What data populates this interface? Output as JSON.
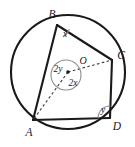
{
  "figure": {
    "type": "circle-geometry-diagram",
    "stroke_color": "#1a1a1a",
    "arc_color": "#8c8c8c",
    "background_color": "#ffffff"
  },
  "circle": {
    "center_label": "O",
    "center": {
      "x": 68,
      "y": 72
    },
    "radius": 57,
    "center_dot_radius": 1.8
  },
  "vertices": [
    {
      "name": "B",
      "label": "B",
      "point": {
        "x": 57,
        "y": 25
      },
      "label_pos": {
        "x": 52,
        "y": 15
      }
    },
    {
      "name": "C",
      "label": "C",
      "point": {
        "x": 112,
        "y": 60
      },
      "label_pos": {
        "x": 121,
        "y": 56
      }
    },
    {
      "name": "D",
      "label": "D",
      "point": {
        "x": 110,
        "y": 118
      },
      "label_pos": {
        "x": 117,
        "y": 127
      }
    },
    {
      "name": "A",
      "label": "A",
      "point": {
        "x": 33,
        "y": 120
      },
      "label_pos": {
        "x": 29,
        "y": 133
      }
    }
  ],
  "sides": [
    {
      "from": "B",
      "to": "C"
    },
    {
      "from": "C",
      "to": "D"
    },
    {
      "from": "D",
      "to": "A"
    },
    {
      "from": "A",
      "to": "B"
    }
  ],
  "radii_dashed": [
    {
      "from": "O",
      "to": "A"
    },
    {
      "from": "O",
      "to": "C"
    }
  ],
  "angles": [
    {
      "name": "angle-at-B",
      "label": "x",
      "vertex": "B",
      "label_pos": {
        "x": 64,
        "y": 35
      },
      "arc_radius": 13
    },
    {
      "name": "angle-at-D",
      "label": "y",
      "vertex": "D",
      "label_pos": {
        "x": 103,
        "y": 110
      },
      "arc_radius": 12
    },
    {
      "name": "central-angle-reflex",
      "label": "2y",
      "vertex": "O",
      "label_pos": {
        "x": 58,
        "y": 69
      },
      "arc_radius": 15
    },
    {
      "name": "central-angle-minor",
      "label": "2x",
      "vertex": "O",
      "label_pos": {
        "x": 73,
        "y": 83
      },
      "arc_radius": 15
    }
  ]
}
